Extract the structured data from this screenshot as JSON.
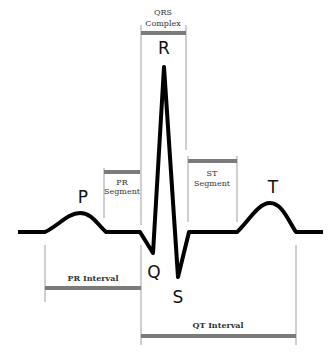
{
  "diagram": {
    "waves": {
      "P": "P",
      "Q": "Q",
      "R": "R",
      "S": "S",
      "T": "T"
    },
    "brackets": {
      "qrs_complex": {
        "line1": "QRS",
        "line2": "Complex"
      },
      "pr_segment": {
        "line1": "PR",
        "line2": "Segment"
      },
      "st_segment": {
        "line1": "ST",
        "line2": "Segment"
      },
      "pr_interval": {
        "label": "PR Interval"
      },
      "qt_interval": {
        "label": "QT Interval"
      }
    },
    "colors": {
      "waveform": "#000000",
      "bracket_bar": "#7a7a7a",
      "guide_line": "#a0a0a0",
      "background": "#ffffff"
    }
  }
}
